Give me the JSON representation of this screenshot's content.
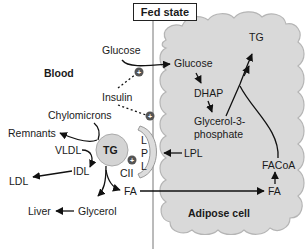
{
  "title": "Fed state",
  "regions": {
    "blood": "Blood",
    "adipose": "Adipose cell"
  },
  "blood_labels": {
    "glucose": "Glucose",
    "insulin": "Insulin",
    "chylomicrons": "Chylomicrons",
    "remnants": "Remnants",
    "vldl": "VLDL",
    "idl": "IDL",
    "ldl": "LDL",
    "tg": "TG",
    "cii": "CII",
    "fa": "FA",
    "liver": "Liver",
    "glycerol": "Glycerol",
    "lpl_vertical": [
      "L",
      "P",
      "L"
    ]
  },
  "adipose_labels": {
    "glucose": "Glucose",
    "dhap": "DHAP",
    "glycerol3p_line1": "Glycerol-3-",
    "glycerol3p_line2": "phosphate",
    "tg": "TG",
    "lpl": "LPL",
    "facoa": "FACoA",
    "fa": "FA"
  },
  "symbols": {
    "plus": "+"
  },
  "colors": {
    "cloud_fill": "#d9d9d9",
    "cloud_stroke": "#b5b5b5",
    "tg_circle_fill": "#d4d4d4",
    "lpl_arc_fill": "#dcdcdc",
    "plus_badge": "#555555",
    "arrow": "#111111"
  }
}
